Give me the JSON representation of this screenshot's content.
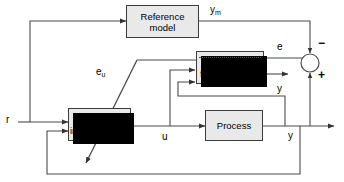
{
  "diagram": {
    "type": "block-diagram",
    "width": 344,
    "height": 182,
    "colors": {
      "block_fill": "#e9e9e9",
      "block_border": "#3c3c3c",
      "wire": "#4a4a4a",
      "shadow": "#000000",
      "background": "#ffffff"
    }
  },
  "blocks": [
    {
      "id": "reference-model",
      "line1": "Reference",
      "line2": "model",
      "shadow": false,
      "dotted_line": false
    },
    {
      "id": "nn-forward-model",
      "line1": "NN",
      "line2": "forward model",
      "shadow": true,
      "dotted_line": true
    },
    {
      "id": "nn-inverse-model",
      "line1": "NN",
      "line2": "inverse model",
      "shadow": true,
      "dotted_line": false
    },
    {
      "id": "process",
      "line1": "Process",
      "line2": "",
      "shadow": false,
      "dotted_line": false
    }
  ],
  "signals": [
    {
      "id": "r",
      "label": "r"
    },
    {
      "id": "ym",
      "label": "y",
      "sub": "m"
    },
    {
      "id": "eu",
      "label": "e",
      "sub": "u"
    },
    {
      "id": "e",
      "label": "e"
    },
    {
      "id": "u",
      "label": "u"
    },
    {
      "id": "y-forward",
      "label": "y"
    },
    {
      "id": "y-process",
      "label": "y"
    }
  ],
  "summing_junction": {
    "id": "summing-junction",
    "plus": "+",
    "minus": "−"
  }
}
